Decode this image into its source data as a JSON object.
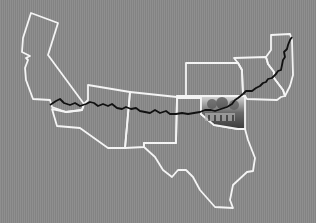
{
  "map": {
    "title": "Route 66 states",
    "background_color": "#888888",
    "border_color": "#f4f4f4",
    "route_color": "#111111",
    "states": [
      {
        "name": "California",
        "id": "ca"
      },
      {
        "name": "Arizona",
        "id": "az"
      },
      {
        "name": "New Mexico",
        "id": "nm"
      },
      {
        "name": "Texas",
        "id": "tx"
      },
      {
        "name": "Oklahoma",
        "id": "ok",
        "fill": "photo"
      },
      {
        "name": "Kansas",
        "id": "ks"
      },
      {
        "name": "Missouri",
        "id": "mo"
      },
      {
        "name": "Illinois",
        "id": "il"
      }
    ],
    "route": {
      "name": "Route 66",
      "from": "Santa Monica",
      "to": "Chicago"
    }
  }
}
